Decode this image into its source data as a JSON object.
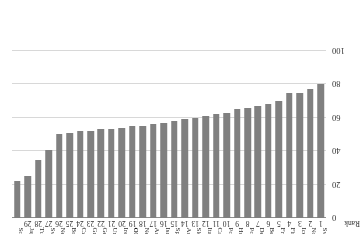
{
  "chart_data": {
    "type": "bar",
    "title": "",
    "xlabel": "",
    "ylabel": "Rank",
    "ylim": [
      0,
      100
    ],
    "yticks": [
      0,
      20,
      40,
      60,
      80,
      100
    ],
    "grid": true,
    "legend": null,
    "orientation": "vertical-inverted",
    "bar_color": "#808080",
    "axis_label": "Rank",
    "ranks": [
      1,
      2,
      3,
      4,
      5,
      6,
      7,
      8,
      9,
      10,
      11,
      12,
      13,
      14,
      15,
      16,
      17,
      18,
      19,
      20,
      21,
      22,
      23,
      24,
      25,
      26,
      27,
      28,
      29
    ],
    "categories": [
      "Sweden",
      "Norway",
      "Iceland",
      "Finland",
      "France",
      "Belgium",
      "Denmark",
      "Portugal",
      "Hungary",
      "Poland",
      "Canada",
      "Italy",
      "Slovakia",
      "Austria",
      "Spain",
      "Israel",
      "Australia",
      "New Zealand",
      "OECD AVERAGE",
      "Ireland",
      "United States",
      "Germany",
      "Greece",
      "Czech Republic",
      "Britain",
      "Netherlands",
      "Switzerland",
      "Turkey",
      "Japan",
      "South Korea"
    ],
    "values": [
      80,
      77,
      75,
      75,
      70,
      68,
      67,
      66,
      65,
      63,
      62,
      61,
      60,
      59,
      58,
      57,
      56,
      55,
      55,
      54,
      53,
      53,
      52,
      52,
      51,
      50,
      41,
      35,
      25,
      22
    ],
    "highlight_category": "OECD AVERAGE"
  }
}
